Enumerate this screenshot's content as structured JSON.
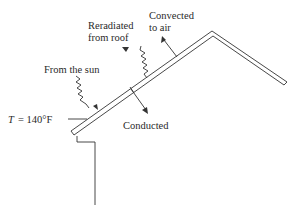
{
  "diagram": {
    "type": "roof heat transfer schematic",
    "labels": {
      "sun": "From the sun",
      "reradiated_line1": "Reradiated",
      "reradiated_line2": "from roof",
      "convected_line1": "Convected",
      "convected_line2": "to air",
      "conducted": "Conducted",
      "temperature_var": "T",
      "temperature_eq": "= 140°F"
    },
    "colors": {
      "line": "#333333",
      "text": "#2a2a2a",
      "background": "#ffffff"
    }
  }
}
